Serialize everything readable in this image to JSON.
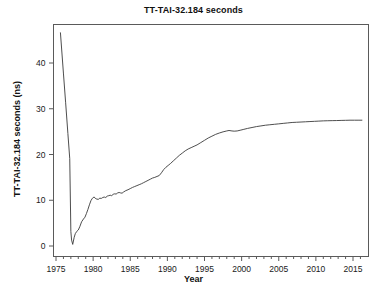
{
  "chart_data": {
    "type": "line",
    "title": "TT-TAI-32.184 seconds",
    "xlabel": "Year",
    "ylabel": "TT-TAI-32.184 seconds (ns)",
    "xlim": [
      1975.0,
      2016.2
    ],
    "ylim": [
      -2.0,
      48.0
    ],
    "xticks": [
      1975,
      1980,
      1985,
      1990,
      1995,
      2000,
      2005,
      2010,
      2015
    ],
    "yticks": [
      0,
      10,
      20,
      30,
      40
    ],
    "xtick_labels": [
      "1975",
      "1980",
      "1985",
      "1990",
      "1995",
      "2000",
      "2005",
      "2010",
      "2015"
    ],
    "ytick_labels": [
      "0",
      "10",
      "20",
      "30",
      "40"
    ],
    "minor_tick_interval_x": 1,
    "grid": false,
    "legend": false,
    "line_color": "#3a3a3a",
    "line_width": 0.9,
    "series": [
      {
        "name": "TT-TAI-32.184",
        "x": [
          1975.6,
          1976.0,
          1976.3,
          1976.6,
          1976.85,
          1977.0,
          1977.1,
          1977.25,
          1977.45,
          1977.6,
          1977.8,
          1978.0,
          1978.2,
          1978.45,
          1978.7,
          1978.9,
          1979.1,
          1979.3,
          1979.5,
          1979.7,
          1979.85,
          1980.0,
          1980.15,
          1980.3,
          1980.5,
          1980.7,
          1980.9,
          1981.1,
          1981.3,
          1981.5,
          1981.7,
          1981.9,
          1982.1,
          1982.3,
          1982.5,
          1982.7,
          1982.9,
          1983.1,
          1983.3,
          1983.5,
          1983.7,
          1983.9,
          1984.1,
          1984.4,
          1984.7,
          1985.0,
          1985.3,
          1985.6,
          1985.9,
          1986.2,
          1986.5,
          1986.8,
          1987.1,
          1987.4,
          1987.7,
          1988.0,
          1988.3,
          1988.6,
          1988.9,
          1989.2,
          1989.5,
          1989.8,
          1990.1,
          1990.4,
          1990.8,
          1991.2,
          1991.6,
          1992.0,
          1992.4,
          1992.8,
          1993.2,
          1993.6,
          1994.0,
          1994.5,
          1995.0,
          1995.5,
          1996.0,
          1996.5,
          1997.0,
          1997.5,
          1998.0,
          1998.3,
          1998.7,
          1999.0,
          1999.4,
          1999.8,
          2000.3,
          2000.8,
          2001.4,
          2002.0,
          2002.6,
          2003.2,
          2003.8,
          2004.4,
          2005.0,
          2005.6,
          2006.2,
          2006.8,
          2007.4,
          2008.0,
          2008.6,
          2009.2,
          2009.8,
          2010.4,
          2011.0,
          2011.6,
          2012.2,
          2012.8,
          2013.4,
          2014.0,
          2014.6,
          2015.2,
          2015.8,
          2016.2
        ],
        "y": [
          46.6,
          37.8,
          31.3,
          24.6,
          19.1,
          3.2,
          1.3,
          0.35,
          1.9,
          2.7,
          3.2,
          3.5,
          4.2,
          5.3,
          5.9,
          6.3,
          7.1,
          8.0,
          9.0,
          9.9,
          10.3,
          10.6,
          10.7,
          10.4,
          10.25,
          10.2,
          10.45,
          10.4,
          10.6,
          10.7,
          10.6,
          10.9,
          11.0,
          11.1,
          11.0,
          11.3,
          11.4,
          11.35,
          11.6,
          11.7,
          11.6,
          11.55,
          11.8,
          12.1,
          12.3,
          12.55,
          12.8,
          13.0,
          13.2,
          13.4,
          13.6,
          13.85,
          14.1,
          14.35,
          14.6,
          14.85,
          15.0,
          15.2,
          15.4,
          16.0,
          16.7,
          17.2,
          17.6,
          18.0,
          18.6,
          19.2,
          19.8,
          20.3,
          20.8,
          21.2,
          21.5,
          21.8,
          22.1,
          22.6,
          23.1,
          23.6,
          24.0,
          24.4,
          24.7,
          24.95,
          25.15,
          25.25,
          25.15,
          25.1,
          25.15,
          25.3,
          25.5,
          25.7,
          25.9,
          26.1,
          26.25,
          26.4,
          26.5,
          26.6,
          26.7,
          26.8,
          26.9,
          27.0,
          27.05,
          27.1,
          27.15,
          27.2,
          27.25,
          27.3,
          27.35,
          27.38,
          27.4,
          27.42,
          27.45,
          27.47,
          27.5,
          27.5,
          27.5,
          27.5
        ]
      }
    ]
  },
  "axes": {
    "frame_color": "#5a5a5a"
  }
}
